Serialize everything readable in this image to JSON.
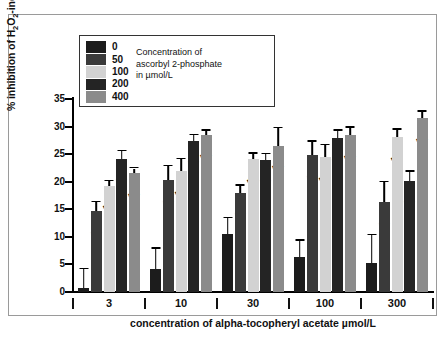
{
  "chart_data": {
    "type": "bar",
    "title": "",
    "xlabel": "concentration of alpha-tocopheryl acetate  µmol/L",
    "ylabel": "% inhibition of H2O2-induced oxidation",
    "ylim": [
      0,
      35
    ],
    "yticks": [
      0,
      5,
      10,
      15,
      20,
      25,
      30,
      35
    ],
    "grid": false,
    "legend_position": "top-left",
    "legend_title": "Concentration of ascorbyl 2-phosphate in µmol/L",
    "categories": [
      "3",
      "10",
      "30",
      "100",
      "300"
    ],
    "series": [
      {
        "name": "0",
        "color": "#1c1c1c",
        "values": [
          0.8,
          4.2,
          10.6,
          6.3,
          5.3
        ],
        "errors": [
          3.3,
          3.6,
          2.8,
          3.0,
          5.0
        ],
        "sig": [
          "",
          "",
          "",
          "",
          ""
        ]
      },
      {
        "name": "50",
        "color": "#3a3a3a",
        "values": [
          14.7,
          20.3,
          18.0,
          24.8,
          16.3
        ],
        "errors": [
          1.6,
          2.5,
          1.3,
          2.4,
          3.6
        ],
        "sig": [
          "***",
          "***",
          "***",
          "***",
          "***"
        ]
      },
      {
        "name": "100",
        "color": "#d2d2d2",
        "values": [
          19.3,
          21.9,
          24.1,
          24.4,
          28.1
        ],
        "errors": [
          0.8,
          2.2,
          1.0,
          2.2,
          1.3
        ],
        "sig": [
          "***",
          "***",
          "***",
          "***",
          "***"
        ]
      },
      {
        "name": "200",
        "color": "#242424",
        "values": [
          24.2,
          27.4,
          24.0,
          27.9,
          20.2
        ],
        "errors": [
          1.3,
          1.0,
          1.0,
          1.3,
          1.6
        ],
        "sig": [
          "***",
          "***",
          "***",
          "***",
          "***"
        ]
      },
      {
        "name": "400",
        "color": "#8b8b8b",
        "values": [
          21.5,
          28.5,
          26.5,
          28.4,
          31.5
        ],
        "errors": [
          0.9,
          0.7,
          3.2,
          1.4,
          1.2
        ],
        "sig": [
          "***",
          "***",
          "***",
          "***",
          "***"
        ]
      }
    ]
  },
  "legend": {
    "caption_line1": "Concentration of",
    "caption_line2": "ascorbyl 2-phosphate",
    "caption_line3": "in µmol/L",
    "entries": [
      {
        "label": "0",
        "color": "#1c1c1c"
      },
      {
        "label": "50",
        "color": "#3a3a3a"
      },
      {
        "label": "100",
        "color": "#d2d2d2"
      },
      {
        "label": "200",
        "color": "#242424"
      },
      {
        "label": "400",
        "color": "#8b8b8b"
      }
    ]
  },
  "axes": {
    "y_title_prefix": "% inhibition of H",
    "y_title_sub1": "2",
    "y_title_mid": "O",
    "y_title_sub2": "2",
    "y_title_suffix": "-induced oxidation",
    "x_title": "concentration of alpha-tocopheryl acetate  µmol/L",
    "y_tick_labels": [
      "0",
      "5",
      "10",
      "15",
      "20",
      "25",
      "30",
      "35"
    ],
    "x_tick_labels": [
      "3",
      "10",
      "30",
      "100",
      "300"
    ]
  }
}
